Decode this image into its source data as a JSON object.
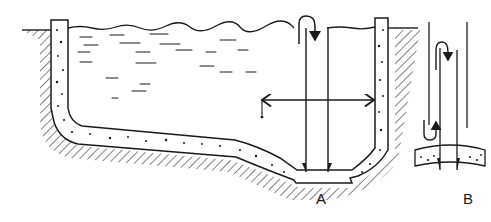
{
  "diagram": {
    "type": "cross-section illustration",
    "labels": {
      "a": "A",
      "b": "B"
    },
    "panels": [
      {
        "id": "A",
        "description": "Full basin cross-section: concrete walls and floor set in hatched ground, water surface at top, vertical drain pipe channel down to sump in sloped floor, horizontal double-headed dimension arrow, curved flow arrow at surface entering pipe"
      },
      {
        "id": "B",
        "description": "Detail of sump: two vertical pipe walls reaching floor segment, curved return arrows showing flow down and back up"
      }
    ],
    "colors": {
      "ink": "#1a1a1a",
      "background": "#ffffff"
    }
  }
}
